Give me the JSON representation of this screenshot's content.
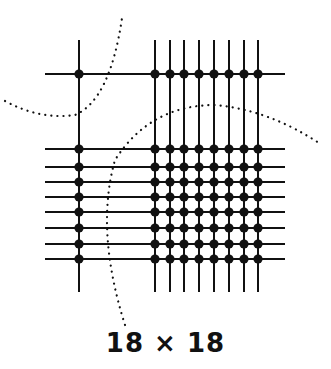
{
  "caption": "18 × 18",
  "colors": {
    "line": "#111111",
    "dot": "#111111",
    "background": "#ffffff"
  },
  "grid": {
    "vertical_lines_x": [
      79,
      155,
      170,
      184,
      199,
      214,
      229,
      244,
      258
    ],
    "horizontal_lines_y": [
      74,
      149,
      167,
      182,
      197,
      212,
      228,
      244,
      259
    ],
    "vertical_span": [
      40,
      292
    ],
    "horizontal_span": [
      45,
      285
    ]
  },
  "dotted_curves": [
    {
      "name": "top-left-arc",
      "path": "M 5 101 Q 40 120 75 115 Q 110 100 122 18"
    },
    {
      "name": "center-arc",
      "path": "M 125 325 Q 95 230 115 160 Q 150 105 215 105 Q 270 110 322 145"
    }
  ]
}
